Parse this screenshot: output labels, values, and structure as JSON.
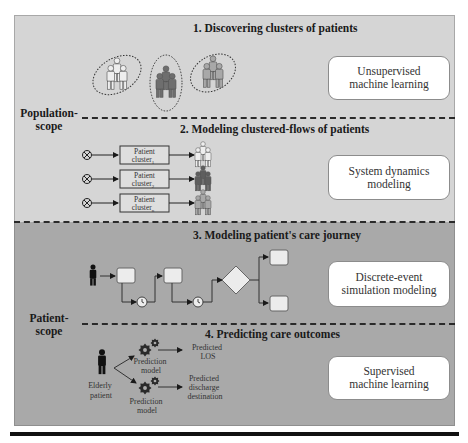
{
  "sections": [
    {
      "id": "s1",
      "title": "1. Discovering clusters of patients",
      "method": "Unsupervised machine learning",
      "method_lines": [
        "Unsupervised",
        "machine learning"
      ]
    },
    {
      "id": "s2",
      "title": "2. Modeling clustered-flows of patients",
      "method": "System dynamics modeling",
      "method_lines": [
        "System dynamics",
        "modeling"
      ]
    },
    {
      "id": "s3",
      "title": "3. Modeling patient's care journey",
      "method": "Discrete-event simulation modeling",
      "method_lines": [
        "Discrete-event",
        "simulation modeling"
      ]
    },
    {
      "id": "s4",
      "title": "4. Predicting care outcomes",
      "method": "Supervised machine learning",
      "method_lines": [
        "Supervised",
        "machine learning"
      ]
    }
  ],
  "scopes": {
    "population": [
      "Population-",
      "scope"
    ],
    "patient": [
      "Patient-",
      "scope"
    ]
  },
  "clusters": {
    "count": 3,
    "shades": [
      "#eeeeee",
      "#6e6e6e",
      "#a8a8a8"
    ]
  },
  "flows": [
    {
      "label": "Patient",
      "sublabel": "cluster",
      "subscript": "1",
      "shade": "#eeeeee"
    },
    {
      "label": "Patient",
      "sublabel": "cluster",
      "subscript": "2",
      "shade": "#5e5e5e"
    },
    {
      "label": "Patient",
      "sublabel": "cluster",
      "subscript": "n",
      "shade": "#a8a8a8"
    }
  ],
  "prediction": {
    "patient_label": [
      "Elderly",
      "patient"
    ],
    "models": [
      {
        "label": [
          "Prediction",
          "model"
        ],
        "output": [
          "Predicted",
          "LOS"
        ]
      },
      {
        "label": [
          "Prediction",
          "model"
        ],
        "output": [
          "Predicted",
          "discharge",
          "destination"
        ]
      }
    ]
  },
  "colors": {
    "population_bg": "#d5d5d5",
    "patient_bg": "#a9a9a9",
    "box_fill": "#ececec",
    "ink": "#1a1a1a"
  }
}
